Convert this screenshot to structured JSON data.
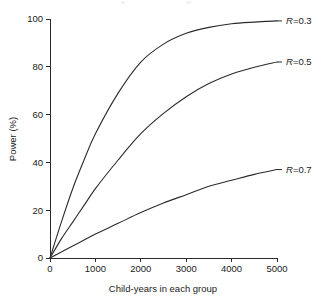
{
  "chart_data": {
    "type": "line",
    "title": "",
    "xlabel": "Child-years in each group",
    "ylabel": "Power (%)",
    "xlim": [
      0,
      5000
    ],
    "ylim": [
      0,
      100
    ],
    "xticks": [
      0,
      1000,
      2000,
      3000,
      4000,
      5000
    ],
    "yticks": [
      0,
      20,
      40,
      60,
      80,
      100
    ],
    "xtick_labels": [
      "0",
      "1000",
      "2000",
      "3000",
      "4000",
      "5000"
    ],
    "ytick_labels": [
      "0",
      "20",
      "40",
      "60",
      "80",
      "100"
    ],
    "grid": false,
    "legend_position": "right-of-curve-ends",
    "x": [
      0,
      250,
      500,
      750,
      1000,
      1500,
      2000,
      2500,
      3000,
      3500,
      4000,
      4500,
      5000
    ],
    "series": [
      {
        "name": "R=0.3",
        "label_prefix": "R",
        "label_suffix": "=0.3",
        "values": [
          0,
          15,
          29,
          41,
          52,
          69,
          82,
          89.5,
          94,
          96.5,
          98,
          98.7,
          99.2
        ],
        "end_value": 99.2,
        "label_x": 5000,
        "label_y": 99.2
      },
      {
        "name": "R=0.5",
        "label_prefix": "R",
        "label_suffix": "=0.5",
        "values": [
          0,
          8,
          15,
          22,
          29,
          41,
          52,
          60.5,
          67.5,
          73,
          77,
          79.8,
          82
        ],
        "end_value": 82,
        "label_x": 5000,
        "label_y": 82
      },
      {
        "name": "R=0.7",
        "label_prefix": "R",
        "label_suffix": "=0.7",
        "values": [
          0,
          2.5,
          5,
          7.5,
          10,
          14.5,
          19,
          23,
          26.5,
          30,
          32.5,
          35,
          37
        ],
        "end_value": 37,
        "label_x": 5000,
        "label_y": 37
      }
    ]
  },
  "axes": {
    "y_title": "Power (%)",
    "x_title": "Child-years in each group"
  },
  "labels": {
    "r03": "R=0.3",
    "r05": "R=0.5",
    "r07": "R=0.7"
  }
}
